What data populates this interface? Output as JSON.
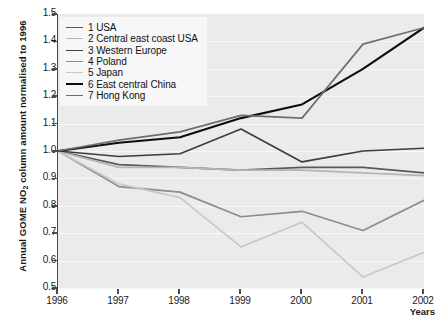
{
  "chart_data": {
    "type": "line",
    "title": "",
    "xlabel": "Years",
    "ylabel": "Annual GOME NO2 column amount normalised to 1996",
    "ylabel_parts": {
      "pre": "Annual GOME NO",
      "sub": "2",
      "post": " column amount normalised to 1996"
    },
    "x": [
      1996,
      1997,
      1998,
      1999,
      2000,
      2001,
      2002
    ],
    "categories": [
      "1996",
      "1997",
      "1998",
      "1999",
      "2000",
      "2001",
      "2002"
    ],
    "xlim": [
      1996,
      2002
    ],
    "ylim": [
      0.5,
      1.5
    ],
    "yticks": [
      "1.5",
      "1.4",
      "1.3",
      "1.2",
      "1.1",
      "1.0",
      "0.9",
      "0.8",
      "0.7",
      "0.6",
      "0.5"
    ],
    "ytick_values": [
      1.5,
      1.4,
      1.3,
      1.2,
      1.1,
      1.0,
      0.9,
      0.8,
      0.7,
      0.6,
      0.5
    ],
    "grid": true,
    "legend_position": "top-left",
    "plot_background": "#ebebeb",
    "series": [
      {
        "name": "1 USA",
        "key": "usa",
        "color": "#595959",
        "width": 1.7,
        "values": [
          1.0,
          0.95,
          0.94,
          0.93,
          0.94,
          0.94,
          0.92
        ]
      },
      {
        "name": "2 Central east coast USA",
        "key": "ce-coast-usa",
        "color": "#b5b5b5",
        "width": 1.7,
        "values": [
          1.0,
          0.94,
          0.94,
          0.93,
          0.93,
          0.92,
          0.91
        ]
      },
      {
        "name": "3 Western Europe",
        "key": "w-europe",
        "color": "#3d3d3d",
        "width": 1.7,
        "values": [
          1.0,
          0.98,
          0.99,
          1.08,
          0.96,
          1.0,
          1.01
        ]
      },
      {
        "name": "4 Poland",
        "key": "poland",
        "color": "#8c8c8c",
        "width": 1.7,
        "values": [
          1.0,
          0.87,
          0.85,
          0.76,
          0.78,
          0.71,
          0.82
        ]
      },
      {
        "name": "5 Japan",
        "key": "japan",
        "color": "#c8c8c8",
        "width": 1.7,
        "values": [
          1.0,
          0.88,
          0.83,
          0.65,
          0.74,
          0.54,
          0.63
        ]
      },
      {
        "name": "6 East central China",
        "key": "e-c-china",
        "color": "#0d0d0d",
        "width": 2.1,
        "values": [
          1.0,
          1.03,
          1.05,
          1.12,
          1.17,
          1.3,
          1.45
        ]
      },
      {
        "name": "7 Hong Kong",
        "key": "hong-kong",
        "color": "#6e6e6e",
        "width": 1.7,
        "values": [
          1.0,
          1.04,
          1.07,
          1.13,
          1.12,
          1.39,
          1.45
        ]
      }
    ]
  }
}
